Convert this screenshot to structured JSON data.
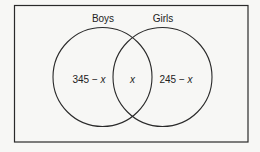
{
  "diagram": {
    "type": "venn",
    "universal_set": {
      "label": ""
    },
    "sets": [
      {
        "name": "Boys",
        "region_label": "345 − x",
        "region_prefix": "345 − ",
        "region_var": "x"
      },
      {
        "name": "Girls",
        "region_label": "245 − x",
        "region_prefix": "245 − ",
        "region_var": "x"
      }
    ],
    "intersection": {
      "label": "x"
    },
    "colors": {
      "stroke": "#2a2a2a",
      "background": "#f7f7f5",
      "text": "#222222"
    }
  }
}
